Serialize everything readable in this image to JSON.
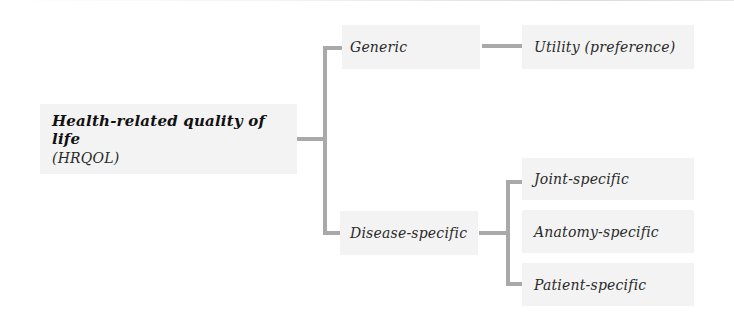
{
  "diagram": {
    "type": "tree",
    "root": {
      "title": "Health-related quality of life",
      "subtitle": "(HRQOL)"
    },
    "level1": [
      {
        "label": "Generic"
      },
      {
        "label": "Disease-specific"
      }
    ],
    "generic_children": [
      {
        "label": "Utility (preference)"
      }
    ],
    "disease_children": [
      {
        "label": "Joint-specific"
      },
      {
        "label": "Anatomy-specific"
      },
      {
        "label": "Patient-specific"
      }
    ],
    "colors": {
      "box_fill": "#f3f3f3",
      "connector": "#a9a9a9",
      "text": "#2a2a2a"
    }
  }
}
